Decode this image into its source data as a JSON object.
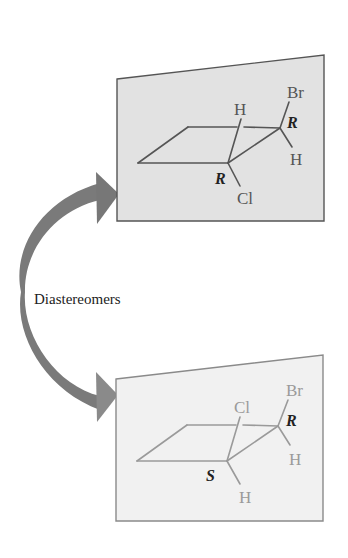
{
  "diagram": {
    "relation_label": "Diastereomers",
    "colors": {
      "arrow": "#7a7a7a",
      "top_panel_fill": "#e2e2e2",
      "bottom_panel_fill": "#f1f1f1",
      "panel_border": "#555555",
      "bottom_panel_border": "#8a8a8a",
      "top_bonds": "#555555",
      "bottom_bonds": "#9a9a9a",
      "config_label": "#222222"
    },
    "top_molecule": {
      "ring": "cyclobutane",
      "front_carbon": {
        "up_substituent": "H",
        "down_substituent": "Cl",
        "configuration": "R"
      },
      "back_carbon": {
        "up_substituent": "Br",
        "down_substituent": "H",
        "configuration": "R"
      }
    },
    "bottom_molecule": {
      "ring": "cyclobutane",
      "front_carbon": {
        "up_substituent": "Cl",
        "down_substituent": "H",
        "configuration": "S"
      },
      "back_carbon": {
        "up_substituent": "Br",
        "down_substituent": "H",
        "configuration": "R"
      }
    }
  }
}
